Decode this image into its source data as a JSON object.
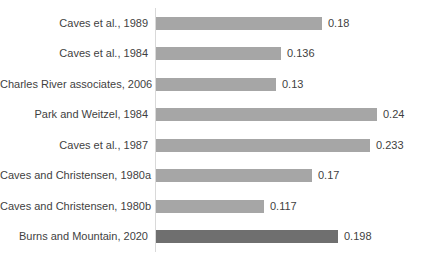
{
  "chart_data": {
    "type": "bar",
    "orientation": "horizontal",
    "title": "",
    "xlabel": "",
    "ylabel": "",
    "legend": "none",
    "gridlines": false,
    "xlim": [
      0,
      0.28
    ],
    "categories": [
      "Caves et al., 1989",
      "Caves et al., 1984",
      "Charles River associates, 2006",
      "Park and Weitzel, 1984",
      "Caves et al., 1987",
      "Caves and Christensen, 1980a",
      "Caves and Christensen, 1980b",
      "Burns and Mountain, 2020"
    ],
    "values": [
      0.18,
      0.136,
      0.13,
      0.24,
      0.233,
      0.17,
      0.117,
      0.198
    ],
    "data_labels": [
      "0.18",
      "0.136",
      "0.13",
      "0.24",
      "0.233",
      "0.17",
      "0.117",
      "0.198"
    ],
    "bar_colors": [
      "#a6a6a6",
      "#a6a6a6",
      "#a6a6a6",
      "#a6a6a6",
      "#a6a6a6",
      "#a6a6a6",
      "#a6a6a6",
      "#6f6f6f"
    ],
    "axis_line_color": "#d9d9d9",
    "text_color": "#3f3f3f",
    "px_per_unit": 920
  }
}
